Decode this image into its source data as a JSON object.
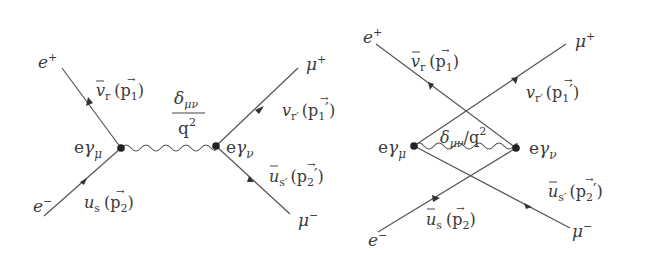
{
  "diagrams": [
    {
      "id": "s-channel",
      "particles": {
        "e_plus": {
          "base": "e",
          "sup": "+"
        },
        "e_minus": {
          "base": "e",
          "sup": "−"
        },
        "mu_plus": {
          "base": "μ",
          "sup": "+"
        },
        "mu_minus": {
          "base": "μ",
          "sup": "−"
        }
      },
      "spinors": {
        "top_left": {
          "base": "v",
          "bar": true,
          "sub": "r",
          "mom": "p",
          "momsub": "1",
          "prime": ""
        },
        "bottom_left": {
          "base": "u",
          "bar": false,
          "sub": "s",
          "mom": "p",
          "momsub": "2",
          "prime": ""
        },
        "top_right": {
          "base": "v",
          "bar": false,
          "sub": "r′",
          "mom": "p",
          "momsub": "1",
          "prime": "′"
        },
        "bottom_right": {
          "base": "u",
          "bar": true,
          "sub": "s′",
          "mom": "p",
          "momsub": "2",
          "prime": "′"
        }
      },
      "vertices": {
        "left": {
          "e": "e",
          "gamma": "γ",
          "sub": "μ"
        },
        "right": {
          "e": "e",
          "gamma": "γ",
          "sub": "ν"
        }
      },
      "propagator": {
        "num": "δ",
        "num_sub": "μν",
        "den": "q",
        "den_sup": "2"
      }
    },
    {
      "id": "crossed",
      "particles": {
        "e_plus": {
          "base": "e",
          "sup": "+"
        },
        "e_minus": {
          "base": "e",
          "sup": "−"
        },
        "mu_plus": {
          "base": "μ",
          "sup": "+"
        },
        "mu_minus": {
          "base": "μ",
          "sup": "−"
        }
      },
      "spinors": {
        "top_left": {
          "base": "v",
          "bar": true,
          "sub": "r",
          "mom": "p",
          "momsub": "1",
          "prime": ""
        },
        "bottom_left": {
          "base": "u",
          "bar": true,
          "sub": "s",
          "mom": "p",
          "momsub": "2",
          "prime": ""
        },
        "top_right": {
          "base": "v",
          "bar": false,
          "sub": "r′",
          "mom": "p",
          "momsub": "1",
          "prime": "′"
        },
        "bottom_right": {
          "base": "u",
          "bar": true,
          "sub": "s′",
          "mom": "p",
          "momsub": "2",
          "prime": "′"
        }
      },
      "vertices": {
        "left": {
          "e": "e",
          "gamma": "γ",
          "sub": "μ"
        },
        "right": {
          "e": "e",
          "gamma": "γ",
          "sub": "ν"
        }
      },
      "propagator": {
        "num": "δ",
        "num_sub": "μν",
        "slash": "/",
        "den": "q",
        "den_sup": "2"
      }
    }
  ],
  "paren_open": "(",
  "paren_close": ")",
  "vec_arrow": "→"
}
